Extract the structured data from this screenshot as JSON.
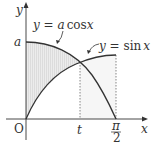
{
  "diagram": {
    "type": "function-graph",
    "curves": [
      {
        "label_prefix": "y = ",
        "label_var": "a",
        "label_func": "cos",
        "label_x": "x",
        "label": "y = a cos x",
        "color": "#333333"
      },
      {
        "label_prefix": "y = ",
        "label_func": "sin",
        "label_x": "x",
        "label": "y = sin x",
        "color": "#333333"
      }
    ],
    "axes": {
      "x_label": "x",
      "y_label": "y",
      "origin_label": "O"
    },
    "ticks": {
      "y_a": "a",
      "x_t": "t",
      "x_pi_num": "π",
      "x_pi_den": "2"
    },
    "shading": {
      "region": "between y-axis, y = a cos x (top) and y = sin x (bottom) for 0 ≤ x ≤ t",
      "color": "#e8e8e8"
    }
  }
}
